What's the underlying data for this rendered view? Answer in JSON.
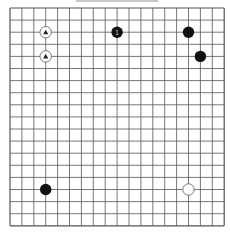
{
  "board": {
    "size": 19,
    "origin_x": 10,
    "origin_y": 8,
    "spacing_x": 11.9,
    "spacing_y": 12.1,
    "line_color": "#555555",
    "background": "#ffffff"
  },
  "colors": {
    "black_stone": "#111111",
    "white_stone_fill": "#ffffff",
    "white_stone_stroke": "#666666",
    "marker_on_white": "#222222",
    "label_on_black": "#bbbbbb"
  },
  "stones": [
    {
      "color": "white",
      "col": 3,
      "row": 2,
      "marker": "triangle",
      "label": ""
    },
    {
      "color": "white",
      "col": 3,
      "row": 4,
      "marker": "triangle",
      "label": ""
    },
    {
      "color": "black",
      "col": 9,
      "row": 2,
      "marker": "",
      "label": "1"
    },
    {
      "color": "black",
      "col": 15,
      "row": 2,
      "marker": "",
      "label": ""
    },
    {
      "color": "black",
      "col": 16,
      "row": 4,
      "marker": "",
      "label": ""
    },
    {
      "color": "black",
      "col": 3,
      "row": 15,
      "marker": "",
      "label": ""
    },
    {
      "color": "white",
      "col": 15,
      "row": 15,
      "marker": "",
      "label": ""
    }
  ]
}
